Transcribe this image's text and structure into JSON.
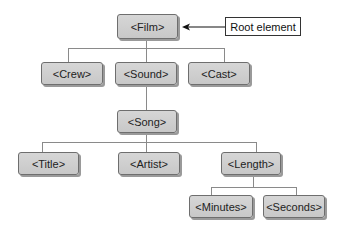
{
  "diagram": {
    "annotation": "Root element",
    "nodes": {
      "film": "<Film>",
      "crew": "<Crew>",
      "sound": "<Sound>",
      "cast": "<Cast>",
      "song": "<Song>",
      "title": "<Title>",
      "artist": "<Artist>",
      "length": "<Length>",
      "minutes": "<Minutes>",
      "seconds": "<Seconds>"
    },
    "edges": [
      [
        "film",
        "crew"
      ],
      [
        "film",
        "sound"
      ],
      [
        "film",
        "cast"
      ],
      [
        "sound",
        "song"
      ],
      [
        "song",
        "title"
      ],
      [
        "song",
        "artist"
      ],
      [
        "song",
        "length"
      ],
      [
        "length",
        "minutes"
      ],
      [
        "length",
        "seconds"
      ]
    ],
    "colors": {
      "node_fill": "#cfcfcf",
      "node_border": "#6e6e6e",
      "node_shadow": "#9a9a9a",
      "connector": "#8a8a8a"
    }
  }
}
